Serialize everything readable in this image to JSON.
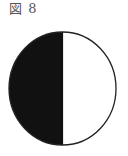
{
  "figure": {
    "title": "図 8",
    "diagram": {
      "type": "half-shaded-circle",
      "shaded_side": "left",
      "shaded_color": "#111111",
      "unshaded_color": "#ffffff",
      "outline_color": "#222222"
    }
  }
}
